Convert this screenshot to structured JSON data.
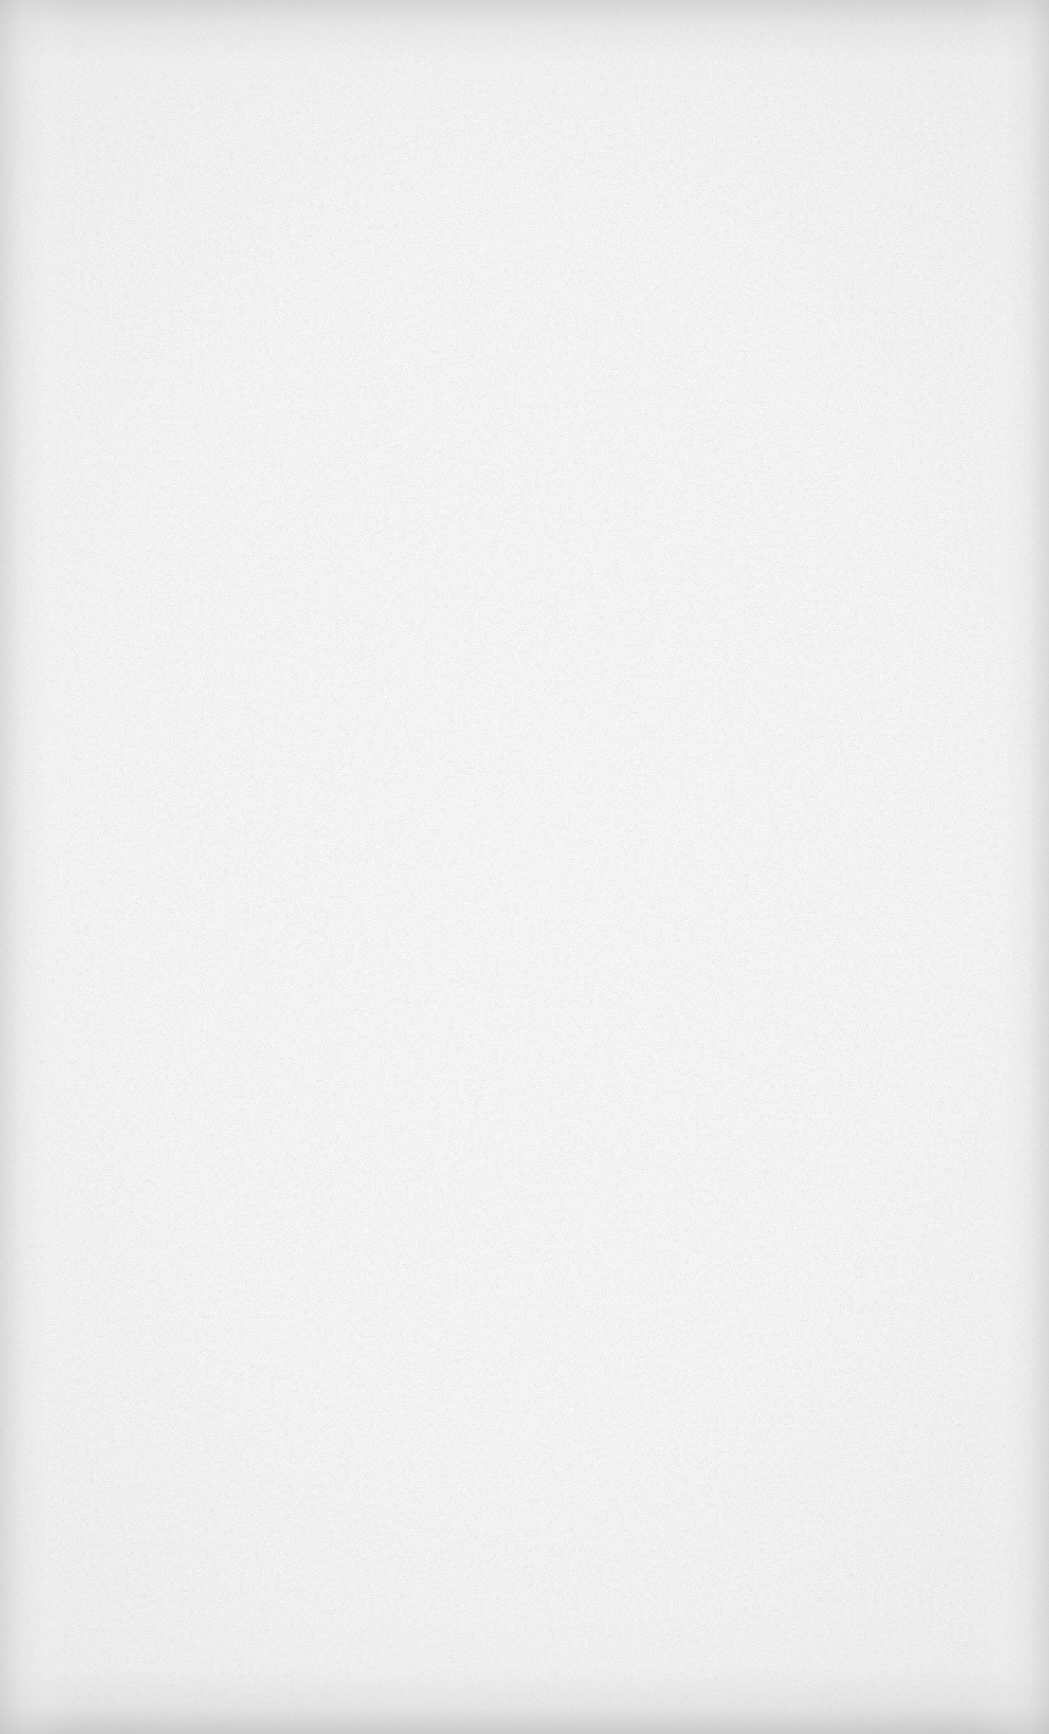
{
  "page": {
    "kind": "blank-scanned-paper",
    "width": 1049,
    "height": 1734,
    "orientation": "portrait",
    "text_content": "",
    "has_text": false,
    "has_graphics": false,
    "has_ui_chrome": false
  },
  "appearance": {
    "paper_color": "#fdfdfd",
    "center_color": "#ffffff",
    "grain_color": "#c9c9cb",
    "vignette_color": "#c4c4c6",
    "bottom_edge_color": "#bcbcbe"
  }
}
